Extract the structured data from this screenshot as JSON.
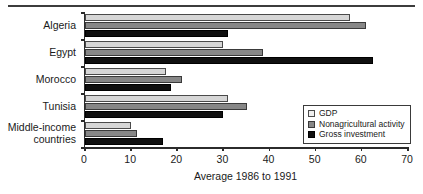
{
  "chart_data": {
    "type": "bar",
    "orientation": "horizontal",
    "title": "",
    "xlabel": "Average 1986 to 1991",
    "ylabel": "",
    "xlim": [
      0,
      70
    ],
    "xticks": [
      0,
      10,
      20,
      30,
      40,
      50,
      60,
      70
    ],
    "grid": false,
    "legend_position": "bottom-right",
    "categories": [
      "Algeria",
      "Egypt",
      "Morocco",
      "Tunisia",
      "Middle-income\ncountries"
    ],
    "series": [
      {
        "name": "GDP",
        "color": "#d6d6d6",
        "values": [
          57.5,
          30.0,
          17.5,
          31.0,
          10.0
        ]
      },
      {
        "name": "Nonagricultural activity",
        "color": "#878787",
        "values": [
          61.0,
          38.5,
          21.0,
          35.0,
          11.3
        ]
      },
      {
        "name": "Gross investment",
        "color": "#101010",
        "values": [
          31.0,
          62.5,
          18.7,
          30.0,
          17.0
        ]
      }
    ]
  },
  "legend": {
    "items": [
      {
        "label": "GDP"
      },
      {
        "label": "Nonagricultural activity"
      },
      {
        "label": "Gross investment"
      }
    ]
  },
  "axis": {
    "x_title": "Average 1986 to 1991",
    "tick_labels": [
      "0",
      "10",
      "20",
      "30",
      "40",
      "50",
      "60",
      "70"
    ]
  }
}
